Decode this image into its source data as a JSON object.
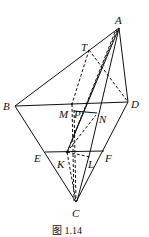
{
  "figure": {
    "caption": "图 1.14",
    "points": {
      "A": {
        "x": 119,
        "y": 28,
        "label": "A",
        "lx": 116,
        "ly": 24
      },
      "B": {
        "x": 15,
        "y": 106,
        "label": "B",
        "lx": 3,
        "ly": 110
      },
      "D": {
        "x": 128,
        "y": 102,
        "label": "D",
        "lx": 132,
        "ly": 108
      },
      "C": {
        "x": 76,
        "y": 202,
        "label": "C",
        "lx": 72,
        "ly": 217
      },
      "T": {
        "x": 89,
        "y": 50,
        "label": "T",
        "lx": 81,
        "ly": 51
      },
      "M": {
        "x": 72,
        "y": 104,
        "label": "M",
        "lx": 58,
        "ly": 118
      },
      "P": {
        "x": 73,
        "y": 113,
        "label": "P",
        "lx": 74,
        "ly": 118
      },
      "N": {
        "x": 96,
        "y": 115,
        "label": "N",
        "lx": 99,
        "ly": 123
      },
      "E": {
        "x": 45,
        "y": 152,
        "label": "E",
        "lx": 34,
        "ly": 162
      },
      "F": {
        "x": 104,
        "y": 151,
        "label": "F",
        "lx": 105,
        "ly": 162
      },
      "K": {
        "x": 67,
        "y": 152,
        "label": "K",
        "lx": 56,
        "ly": 168
      },
      "L": {
        "x": 90,
        "y": 152,
        "label": "L",
        "lx": 88,
        "ly": 168
      }
    },
    "solid_lines": [
      [
        "A",
        "B"
      ],
      [
        "A",
        "D"
      ],
      [
        "B",
        "D"
      ],
      [
        "B",
        "C"
      ],
      [
        "D",
        "C"
      ],
      [
        "E",
        "F"
      ],
      [
        "P",
        "N"
      ]
    ],
    "dashed_lines": [
      [
        "T",
        "D"
      ],
      [
        "T",
        "K"
      ],
      [
        "A",
        "K"
      ],
      [
        "K",
        "N"
      ],
      [
        "K",
        "C"
      ],
      [
        "K",
        "L"
      ]
    ]
  }
}
